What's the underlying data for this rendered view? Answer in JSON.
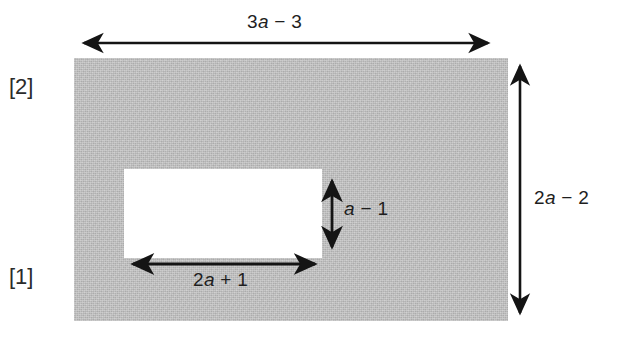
{
  "figure": {
    "type": "geometry-diagram",
    "background_color": "#ffffff",
    "shaded_color": "#bebebe",
    "hole_color": "#ffffff",
    "stroke_color": "#1e1e1e"
  },
  "shapes": {
    "outer_rectangle": {
      "name": "shaded-outer-rectangle",
      "x": 74,
      "y": 58,
      "width": 434,
      "height": 263,
      "width_label": "3a − 3",
      "height_label": "2a − 2"
    },
    "inner_rectangle": {
      "name": "white-inner-rectangle",
      "x": 124,
      "y": 169,
      "width": 198,
      "height": 89,
      "width_label": "2a + 1",
      "height_label": "a − 1"
    }
  },
  "labels": {
    "top": {
      "prefix": "3",
      "variable": "a",
      "suffix": " − 3",
      "full": "3a − 3"
    },
    "right": {
      "prefix": "2",
      "variable": "a",
      "suffix": " − 2",
      "full": "2a − 2"
    },
    "inner_bottom": {
      "prefix": "2",
      "variable": "a",
      "suffix": " + 1",
      "full": "2a + 1"
    },
    "inner_right": {
      "prefix": "",
      "variable": "a",
      "suffix": " − 1",
      "full": "a − 1"
    },
    "bracket_upper": "[2]",
    "bracket_lower": "[1]"
  },
  "arrows": [
    {
      "name": "top-width-dimension-arrow",
      "orientation": "horizontal",
      "x1": 75,
      "y1": 43,
      "x2": 497,
      "y2": 43,
      "double_headed": true
    },
    {
      "name": "right-height-dimension-arrow",
      "orientation": "vertical",
      "x1": 520,
      "y1": 57,
      "x2": 520,
      "y2": 322,
      "double_headed": true
    },
    {
      "name": "inner-width-dimension-arrow",
      "orientation": "horizontal",
      "x1": 124,
      "y1": 264,
      "x2": 324,
      "y2": 264,
      "double_headed": true
    },
    {
      "name": "inner-height-dimension-arrow",
      "orientation": "vertical",
      "x1": 332,
      "y1": 172,
      "x2": 332,
      "y2": 256,
      "double_headed": true
    }
  ]
}
